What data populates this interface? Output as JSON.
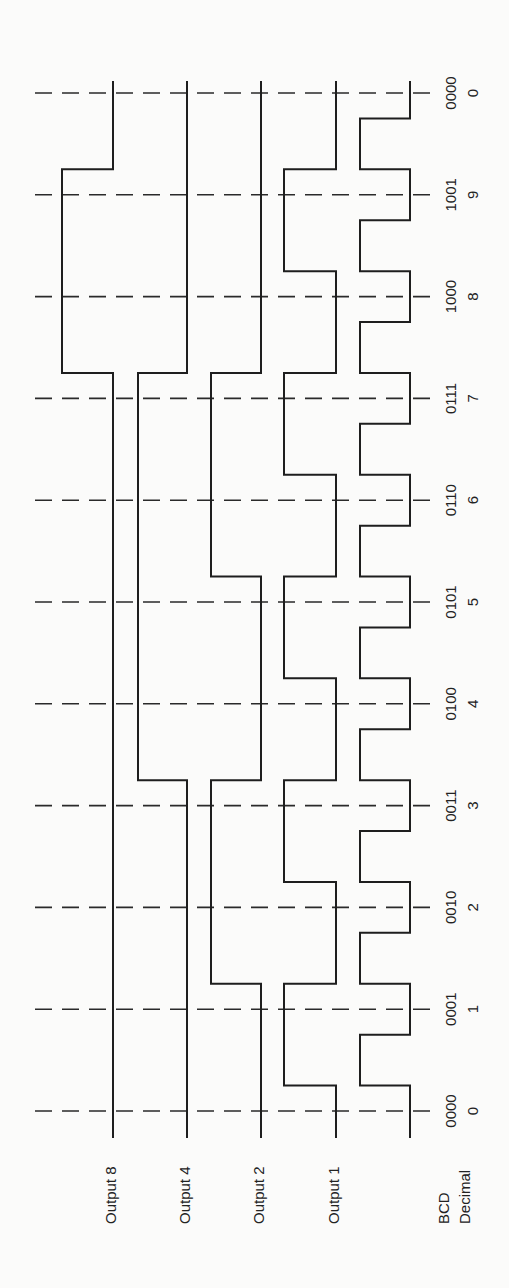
{
  "colors": {
    "background": "#fbfbfa",
    "stroke": "#1e1e1e"
  },
  "signals": [
    {
      "name": "output-8",
      "label": "Output 8",
      "bit": 8
    },
    {
      "name": "output-4",
      "label": "Output 4",
      "bit": 4
    },
    {
      "name": "output-2",
      "label": "Output 2",
      "bit": 2
    },
    {
      "name": "output-1",
      "label": "Output 1",
      "bit": 1
    },
    {
      "name": "clock",
      "label": "",
      "bit": 0
    }
  ],
  "axis_labels": {
    "bcd": "BCD",
    "decimal": "Decimal"
  },
  "counts": [
    {
      "bcd": "0000",
      "decimal": "0"
    },
    {
      "bcd": "0001",
      "decimal": "1"
    },
    {
      "bcd": "0010",
      "decimal": "2"
    },
    {
      "bcd": "0011",
      "decimal": "3"
    },
    {
      "bcd": "0100",
      "decimal": "4"
    },
    {
      "bcd": "0101",
      "decimal": "5"
    },
    {
      "bcd": "0110",
      "decimal": "6"
    },
    {
      "bcd": "0111",
      "decimal": "7"
    },
    {
      "bcd": "1000",
      "decimal": "8"
    },
    {
      "bcd": "1001",
      "decimal": "9"
    },
    {
      "bcd": "0000",
      "decimal": "0"
    }
  ],
  "waveforms": {
    "output-8": [
      0,
      0,
      0,
      0,
      0,
      0,
      0,
      0,
      1,
      1,
      0
    ],
    "output-4": [
      0,
      0,
      0,
      0,
      1,
      1,
      1,
      1,
      0,
      0,
      0
    ],
    "output-2": [
      0,
      0,
      1,
      1,
      0,
      0,
      1,
      1,
      0,
      0,
      0
    ],
    "output-1": [
      0,
      1,
      0,
      1,
      0,
      1,
      0,
      1,
      0,
      1,
      0
    ],
    "clock": "pulse train: one high pulse per count interval, 10 pulses"
  }
}
